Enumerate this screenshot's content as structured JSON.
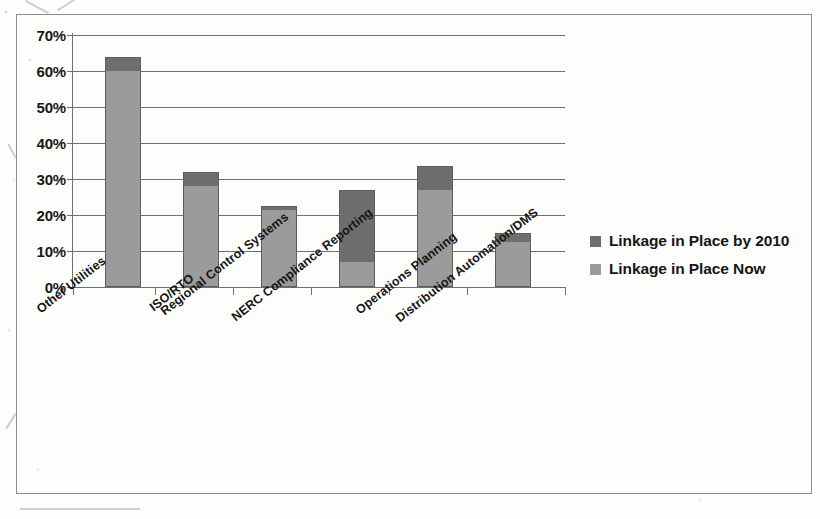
{
  "chart_data": {
    "type": "bar",
    "subtype": "stacked-bar",
    "title": "",
    "xlabel": "",
    "ylabel": "",
    "ylim": [
      0,
      70
    ],
    "ytick_labels": [
      "70%",
      "60%",
      "50%",
      "40%",
      "30%",
      "20%",
      "10%",
      "0%"
    ],
    "ytick_values": [
      70,
      60,
      50,
      40,
      30,
      20,
      10,
      0
    ],
    "grid": true,
    "legend_position": "right",
    "categories": [
      "Other Utilities",
      "ISO/RTO",
      "Regional Control Systems",
      "NERC Compliance Reporting",
      "Operations Planning",
      "Distribution Automation/DMS"
    ],
    "series": [
      {
        "name": "Linkage in Place Now",
        "color": "#9b9b9b",
        "values": [
          60,
          28,
          21.5,
          7,
          27,
          12.5
        ]
      },
      {
        "name": "Linkage in Place by 2010",
        "color": "#6e6e6e",
        "values": [
          4,
          4,
          1,
          20,
          6.5,
          2.5
        ]
      }
    ],
    "totals": [
      64,
      32,
      22.5,
      27,
      33.5,
      15
    ]
  },
  "legend": {
    "entries": [
      {
        "label": "Linkage in Place by 2010",
        "color": "#6e6e6e"
      },
      {
        "label": "Linkage in Place Now",
        "color": "#9b9b9b"
      }
    ]
  }
}
